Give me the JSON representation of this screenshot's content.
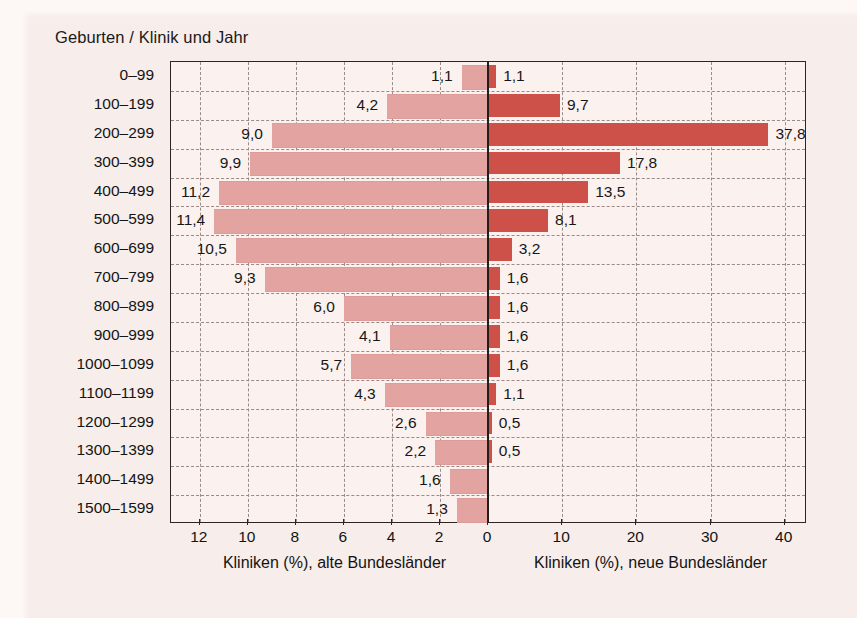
{
  "chart_data": {
    "type": "bar",
    "orientation": "horizontal",
    "layout": "diverging-population-pyramid",
    "title": "Geburten / Klinik und Jahr",
    "categories": [
      "0–99",
      "100–199",
      "200–299",
      "300–399",
      "400–499",
      "500–599",
      "600–699",
      "700–799",
      "800–899",
      "900–999",
      "1000–1099",
      "1100–1199",
      "1200–1299",
      "1300–1399",
      "1400–1499",
      "1500–1599"
    ],
    "series": [
      {
        "name": "Kliniken (%), alte Bundesländer",
        "side": "left",
        "color": "#e2a3a1",
        "values": [
          1.1,
          4.2,
          9.0,
          9.9,
          11.2,
          11.4,
          10.5,
          9.3,
          6.0,
          4.1,
          5.7,
          4.3,
          2.6,
          2.2,
          1.6,
          1.3
        ],
        "labels": [
          "1,1",
          "4,2",
          "9,0",
          "9,9",
          "11,2",
          "11,4",
          "10,5",
          "9,3",
          "6,0",
          "4,1",
          "5,7",
          "4,3",
          "2,6",
          "2,2",
          "1,6",
          "1,3"
        ]
      },
      {
        "name": "Kliniken (%), neue Bundesländer",
        "side": "right",
        "color": "#cd5149",
        "values": [
          1.1,
          9.7,
          37.8,
          17.8,
          13.5,
          8.1,
          3.2,
          1.6,
          1.6,
          1.6,
          1.6,
          1.1,
          0.5,
          0.5,
          null,
          null
        ],
        "labels": [
          "1,1",
          "9,7",
          "37,8",
          "17,8",
          "13,5",
          "8,1",
          "3,2",
          "1,6",
          "1,6",
          "1,6",
          "1,6",
          "1,1",
          "0,5",
          "0,5",
          "",
          ""
        ]
      }
    ],
    "left_axis": {
      "label": "Kliniken (%), alte Bundesländer",
      "ticks": [
        "12",
        "10",
        "8",
        "6",
        "4",
        "2",
        "0"
      ],
      "tick_values": [
        12,
        10,
        8,
        6,
        4,
        2,
        0
      ],
      "max": 13.2,
      "grid": true
    },
    "right_axis": {
      "label": "Kliniken (%), neue Bundesländer",
      "ticks": [
        "0",
        "10",
        "20",
        "30",
        "40"
      ],
      "tick_values": [
        0,
        10,
        20,
        30,
        40
      ],
      "max": 43.0,
      "grid": true
    },
    "ylabel": "Geburten / Klinik und Jahr",
    "grid": true,
    "legend": "none",
    "colors": {
      "left_bars": "#e2a3a1",
      "right_bars": "#cd5149",
      "background": "#f7edea",
      "plot_background": "#fbf1ee",
      "frame": "#2b2523",
      "gridline": "#9b8a86",
      "text": "#141414"
    }
  }
}
